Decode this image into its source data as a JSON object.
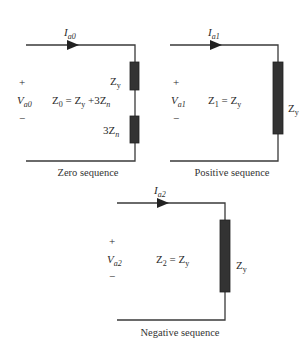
{
  "colors": {
    "wire": "#3a3a3a",
    "resistor": "#333333",
    "text": "#2a2a2a"
  },
  "circuits": [
    {
      "name": "zero",
      "caption": "Zero sequence",
      "current": {
        "main": "I",
        "sub": "a0"
      },
      "voltage": {
        "plus": "+",
        "main": "V",
        "sub": "a0",
        "minus": "−"
      },
      "equation": {
        "lhs": "Z",
        "lhs_sub": "0",
        "rhs": "= Z",
        "rhs_sub": "y",
        "tail": " +3Z",
        "tail_sub": "n"
      },
      "impedances": [
        {
          "main": "Z",
          "sub": "y"
        },
        {
          "main": "3Z",
          "sub": "n"
        }
      ]
    },
    {
      "name": "positive",
      "caption": "Positive sequence",
      "current": {
        "main": "I",
        "sub": "a1"
      },
      "voltage": {
        "plus": "+",
        "main": "V",
        "sub": "a1",
        "minus": "−"
      },
      "equation": {
        "lhs": "Z",
        "lhs_sub": "1",
        "rhs": "= Z",
        "rhs_sub": "y"
      },
      "impedances": [
        {
          "main": "Z",
          "sub": "y"
        }
      ]
    },
    {
      "name": "negative",
      "caption": "Negative sequence",
      "current": {
        "main": "I",
        "sub": "a2"
      },
      "voltage": {
        "plus": "+",
        "main": "V",
        "sub": "a2",
        "minus": "−"
      },
      "equation": {
        "lhs": "Z",
        "lhs_sub": "2",
        "rhs": "= Z",
        "rhs_sub": "y"
      },
      "impedances": [
        {
          "main": "Z",
          "sub": "y"
        }
      ]
    }
  ]
}
